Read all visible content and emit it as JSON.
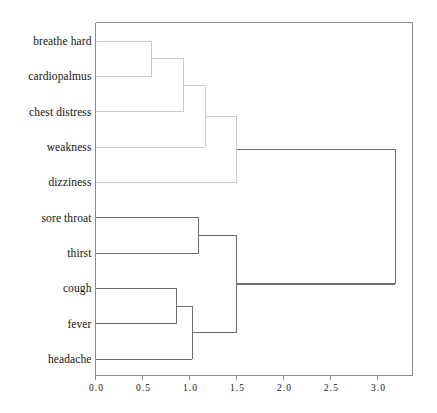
{
  "chart_data": {
    "type": "dendrogram",
    "title": "",
    "xlabel": "",
    "ylabel": "",
    "orientation": "horizontal",
    "grid": false,
    "legend": null,
    "xlim": [
      0.0,
      3.4
    ],
    "xticks": [
      0.0,
      0.5,
      1.0,
      1.5,
      2.0,
      2.5,
      3.0
    ],
    "xticklabels": [
      "0.0",
      "0.5",
      "1.0",
      "1.5",
      "2.0",
      "2.5",
      "3.0"
    ],
    "leaves": [
      "breathe hard",
      "cardiopalmus",
      "chest distress",
      "weakness",
      "dizziness",
      "sore throat",
      "thirst",
      "cough",
      "fever",
      "headache"
    ],
    "merges": [
      {
        "id": "m1",
        "left": "breathe hard",
        "right": "cardiopalmus",
        "height": 0.6
      },
      {
        "id": "m2",
        "left": "m1",
        "right": "chest distress",
        "height": 0.94
      },
      {
        "id": "m3",
        "left": "m2",
        "right": "weakness",
        "height": 1.17
      },
      {
        "id": "m4",
        "left": "m3",
        "right": "dizziness",
        "height": 1.5
      },
      {
        "id": "m5",
        "left": "sore throat",
        "right": "thirst",
        "height": 1.1
      },
      {
        "id": "m6",
        "left": "cough",
        "right": "fever",
        "height": 0.86
      },
      {
        "id": "m7",
        "left": "m6",
        "right": "headache",
        "height": 1.03
      },
      {
        "id": "m8",
        "left": "m5",
        "right": "m7",
        "height": 1.5
      },
      {
        "id": "m9",
        "left": "m4",
        "right": "m8",
        "height": 3.19
      }
    ],
    "colors": {
      "frame": "#8a8a8a",
      "link_light": "#c9c9c9",
      "link_dark": "#6e6e6e",
      "text": "#141414",
      "background": "#ffffff"
    }
  }
}
